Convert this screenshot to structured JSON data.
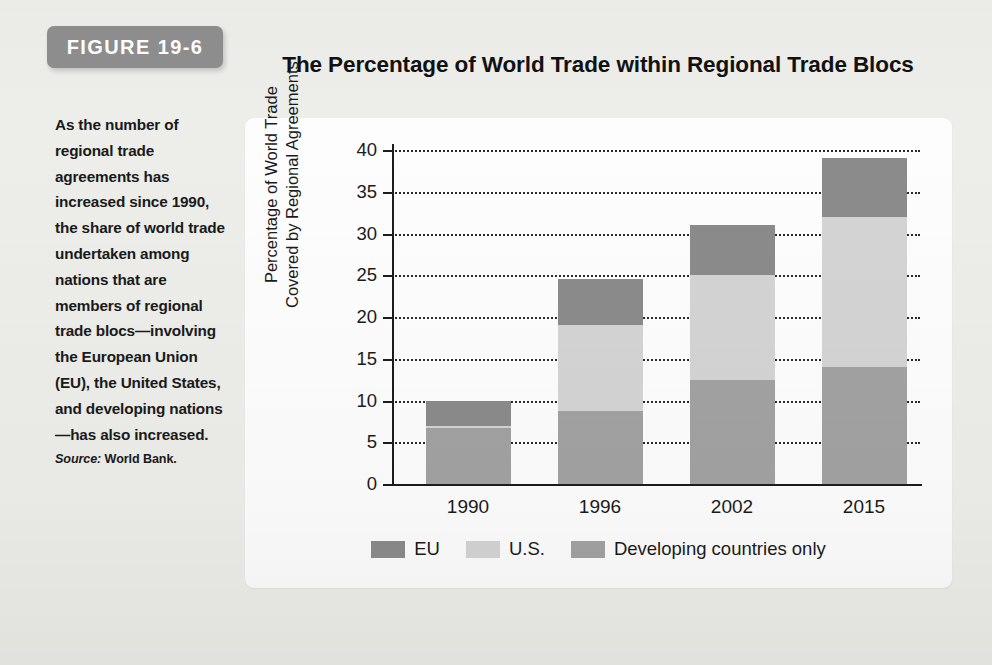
{
  "figure": {
    "badge_label": "FIGURE 19-6",
    "title": "The Percentage of World Trade within Regional Trade Blocs",
    "caption": "As the number of regional trade agreements has increased since 1990, the share of world trade undertaken among nations that are members of regional trade blocs—involving the European Union (EU), the United States, and developing nations—has also increased.",
    "source_label": "Source:",
    "source_value": "World Bank."
  },
  "colors": {
    "badge_bg": "#8e8e8e",
    "page_bg": "#ededea",
    "panel_bg": "#fdfdfd",
    "eu": "#8b8b8b",
    "us": "#d4d4d4",
    "developing": "#a2a2a2",
    "axis": "#1c1c1c"
  },
  "chart_data": {
    "type": "bar",
    "stacked": true,
    "title": "The Percentage of World Trade within Regional Trade Blocs",
    "xlabel": "",
    "ylabel": "Percentage of World Trade Covered by Regional Agreements",
    "ylabel_line1": "Percentage of World Trade",
    "ylabel_line2": "Covered by Regional Agreements",
    "categories": [
      "1990",
      "1996",
      "2002",
      "2015"
    ],
    "ylim": [
      0,
      40
    ],
    "yticks": [
      0,
      5,
      10,
      15,
      20,
      25,
      30,
      35,
      40
    ],
    "grid": "horizontal-dotted",
    "legend_position": "bottom",
    "series": [
      {
        "name": "Developing countries only",
        "key": "developing",
        "values": [
          6.7,
          8.7,
          12.5,
          14.0
        ]
      },
      {
        "name": "U.S.",
        "key": "us",
        "values": [
          0.3,
          10.3,
          12.5,
          18.0
        ]
      },
      {
        "name": "EU",
        "key": "eu",
        "values": [
          3.0,
          5.5,
          6.0,
          7.0
        ]
      }
    ],
    "totals": [
      10.0,
      24.5,
      31.0,
      39.0
    ],
    "legend": [
      {
        "label": "EU",
        "key": "eu"
      },
      {
        "label": "U.S.",
        "key": "us"
      },
      {
        "label": "Developing countries only",
        "key": "developing"
      }
    ]
  }
}
